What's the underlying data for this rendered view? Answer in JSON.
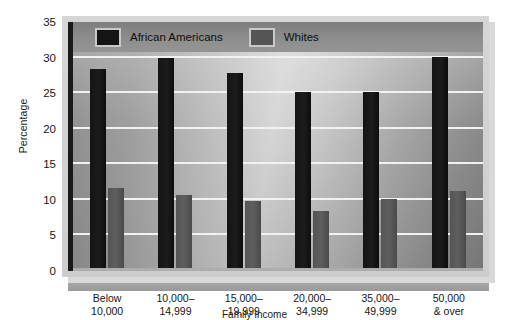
{
  "chart_data": {
    "type": "bar",
    "title": "",
    "xlabel": "Family Income",
    "ylabel": "Percentage",
    "ylim": [
      0,
      35
    ],
    "yticks": [
      0,
      5,
      10,
      15,
      20,
      25,
      30,
      35
    ],
    "ytick_labels": [
      "0",
      "5",
      "10",
      "15",
      "20",
      "25",
      "30",
      "35"
    ],
    "grid": true,
    "legend_position": "top-left-inside",
    "categories": [
      "Below\n10,000",
      "10,000–\n14,999",
      "15,000–\n19,999",
      "20,000–\n34,999",
      "35,000–\n49,999",
      "50,000\n& over"
    ],
    "category_lines": [
      [
        "Below",
        "10,000"
      ],
      [
        "10,000–",
        "14,999"
      ],
      [
        "15,000–",
        "19,999"
      ],
      [
        "20,000–",
        "34,999"
      ],
      [
        "35,000–",
        "49,999"
      ],
      [
        "50,000",
        "& over"
      ]
    ],
    "series": [
      {
        "name": "African Americans",
        "color": "#141414",
        "values": [
          28.4,
          30.0,
          27.9,
          25.1,
          25.1,
          30.1
        ]
      },
      {
        "name": "Whites",
        "color": "#555555",
        "values": [
          11.7,
          10.7,
          9.9,
          8.4,
          10.1,
          11.2
        ]
      }
    ]
  },
  "legend": {
    "items": [
      {
        "label": "African Americans",
        "swatch": "#141414"
      },
      {
        "label": "Whites",
        "swatch": "#555555"
      }
    ]
  },
  "axes": {
    "y_title": "Percentage",
    "x_title": "Family Income"
  }
}
